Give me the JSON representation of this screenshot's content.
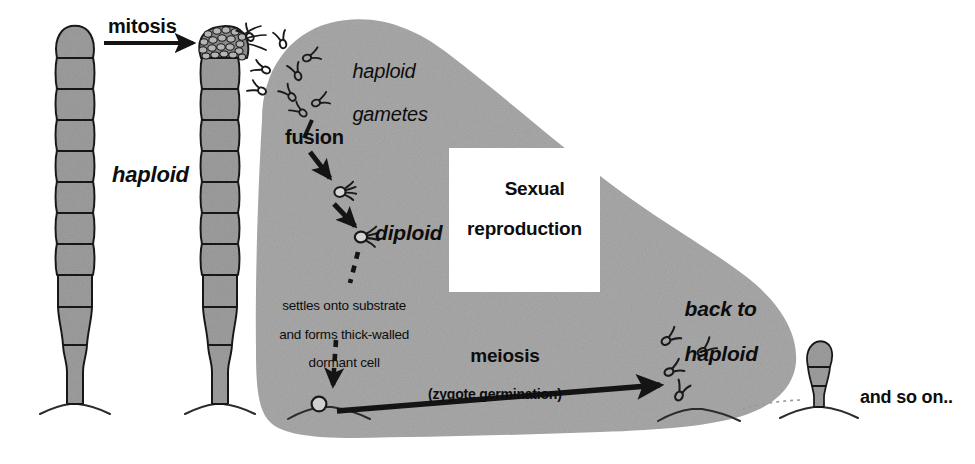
{
  "figure": {
    "organism_stage_left": "haploid filament",
    "background_color": "#ffffff",
    "blob_color": "#a9a9a9",
    "cell_fill_color": "#9e9e9e",
    "ink_color": "#1a1a1a"
  },
  "labels": {
    "mitosis": "mitosis",
    "haploid_left": "haploid",
    "haploid_gametes_line1": "haploid",
    "haploid_gametes_line2": "gametes",
    "fusion": "fusion",
    "diploid": "diploid",
    "sexual_line1": "Sexual",
    "sexual_line2": "reproduction",
    "settles_line1": "settles onto substrate",
    "settles_line2": "and forms thick-walled",
    "settles_line3": "dormant cell",
    "meiosis": "meiosis",
    "meiosis_sub": "(zygote germination)",
    "back_to_haploid_line1": "back to",
    "back_to_haploid_line2": "haploid",
    "and_so_on": "and so on.."
  },
  "structures": {
    "filament_plain": {
      "name": "haploid filament",
      "cell_count": 10,
      "has_holdfast": true
    },
    "filament_sporangium": {
      "name": "haploid filament with sporangium",
      "cell_count": 10,
      "has_sporangium": true,
      "has_holdfast": true
    },
    "gamete_swarm_top": {
      "name": "haploid gametes",
      "count": 9,
      "flagella_per_cell": 2
    },
    "zygote_upper": {
      "name": "fusing gametes / young zygote",
      "flagella": 4
    },
    "zygote_lower": {
      "name": "diploid zygote",
      "flagella": 4
    },
    "dormant_cell": {
      "name": "thick-walled dormant cell",
      "shape": "small open circle on substrate"
    },
    "gamete_swarm_right": {
      "name": "newly released haploid gametes",
      "count": 4
    },
    "germling": {
      "name": "young germling filament",
      "cell_count": 2,
      "has_holdfast": true
    }
  },
  "arrows": [
    {
      "name": "mitosis-arrow",
      "style": "solid",
      "direction": "right",
      "label": "mitosis"
    },
    {
      "name": "fusion-arrow-1",
      "style": "solid",
      "direction": "down-right",
      "label": "fusion"
    },
    {
      "name": "fusion-arrow-2",
      "style": "solid",
      "direction": "down-right",
      "label": ""
    },
    {
      "name": "settling-arrow-upper",
      "style": "dashed",
      "direction": "down",
      "label": "settles onto substrate"
    },
    {
      "name": "settling-arrow-lower",
      "style": "dashed",
      "direction": "down",
      "label": ""
    },
    {
      "name": "meiosis-arrow",
      "style": "solid",
      "direction": "up-right",
      "label": "meiosis (zygote germination)"
    }
  ]
}
